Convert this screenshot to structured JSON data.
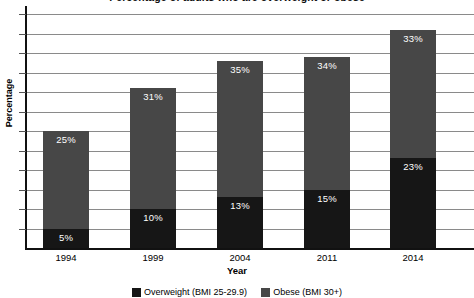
{
  "chart_data": {
    "type": "bar",
    "subtype": "stacked-bar",
    "title": "Percentage of adults who are overweight or obese",
    "xlabel": "Year",
    "ylabel": "Percentage",
    "categories": [
      "1994",
      "1999",
      "2004",
      "2011",
      "2014"
    ],
    "series": [
      {
        "name": "Overweight (BMI 25-29.9)",
        "color": "#474747",
        "values": [
          25,
          31,
          35,
          34,
          33
        ],
        "labels": [
          "25%",
          "31%",
          "35%",
          "34%",
          "33%"
        ]
      },
      {
        "name": "Obese (BMI 30+)",
        "color": "#161616",
        "values": [
          5,
          10,
          13,
          15,
          23
        ],
        "labels": [
          "5%",
          "10%",
          "13%",
          "15%",
          "23%"
        ]
      }
    ],
    "totals": [
      30,
      41,
      48,
      49,
      56
    ],
    "ylim": [
      0,
      60
    ],
    "y_tick_step": 5,
    "y_tick_labels_visible": false,
    "grid": true,
    "legend_position": "bottom",
    "px_per_percent": 3.9,
    "baseline_y": 248
  },
  "axes": {
    "y_title": "Percentage",
    "x_title": "Year"
  },
  "legend": {
    "items": [
      {
        "label": "Overweight (BMI 25-29.9)",
        "color": "#161616"
      },
      {
        "label": "Obese (BMI 30+)",
        "color": "#474747"
      }
    ]
  },
  "colors": {
    "overweight": "#474747",
    "obese": "#161616",
    "gridline": "#8a8a8a",
    "axis": "#111111",
    "background": "#ffffff",
    "value_label": "#ffffff"
  }
}
